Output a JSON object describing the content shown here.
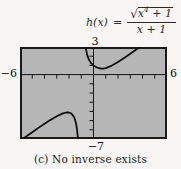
{
  "formula": {
    "lhs": "h(x)",
    "equals": "=",
    "radical_sign": "√",
    "numerator_base": "x",
    "numerator_exponent": "4",
    "numerator_tail": " + 1",
    "denominator": "x + 1"
  },
  "graph": {
    "top_label": "3",
    "left_label": "−6",
    "right_label": "6",
    "bottom_label": "−7",
    "bg_color": "#b6b6b6",
    "border_color": "#1a1a1a",
    "axis_color": "#151515",
    "curve_color": "#101010"
  },
  "caption": "(c) No inverse exists",
  "chart_data": {
    "type": "line",
    "xlabel": "x",
    "ylabel": "h(x)",
    "xlim": [
      -6,
      6
    ],
    "ylim": [
      -7,
      3
    ],
    "xtick_step": 1,
    "ytick_step": 1,
    "grid": false,
    "legend": false,
    "window_labels": {
      "top": "3",
      "left": "−6",
      "right": "6",
      "bottom": "−7"
    },
    "series": [
      {
        "name": "branch-x-less-than-minus-1",
        "points": [
          [
            -5.8,
            -7
          ],
          [
            -5.5,
            -6.73
          ],
          [
            -5,
            -6.26
          ],
          [
            -4.5,
            -5.79
          ],
          [
            -4,
            -5.34
          ],
          [
            -3.5,
            -4.92
          ],
          [
            -3,
            -4.53
          ],
          [
            -2.5,
            -4.22
          ],
          [
            -2.2,
            -4.12
          ],
          [
            -2,
            -4.12
          ],
          [
            -1.8,
            -4.24
          ],
          [
            -1.6,
            -4.58
          ],
          [
            -1.5,
            -4.92
          ],
          [
            -1.4,
            -5.5
          ],
          [
            -1.35,
            -5.94
          ],
          [
            -1.3,
            -6.55
          ],
          [
            -1.27,
            -7
          ]
        ]
      },
      {
        "name": "branch-x-greater-than-minus-1",
        "points": [
          [
            -0.64,
            3
          ],
          [
            -0.6,
            2.66
          ],
          [
            -0.5,
            2.06
          ],
          [
            -0.4,
            1.69
          ],
          [
            -0.2,
            1.25
          ],
          [
            0,
            1
          ],
          [
            0.2,
            0.83
          ],
          [
            0.4,
            0.72
          ],
          [
            0.6,
            0.66
          ],
          [
            0.7,
            0.655
          ],
          [
            0.8,
            0.66
          ],
          [
            1,
            0.71
          ],
          [
            1.5,
            0.98
          ],
          [
            2,
            1.37
          ],
          [
            2.5,
            1.81
          ],
          [
            3,
            2.26
          ],
          [
            3.5,
            2.73
          ],
          [
            3.79,
            3
          ]
        ]
      }
    ]
  }
}
